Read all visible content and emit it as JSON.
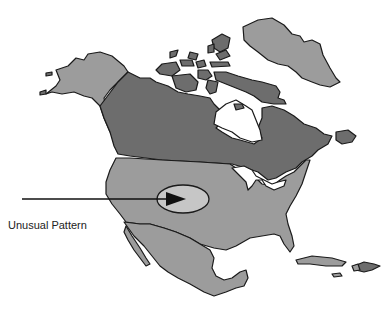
{
  "map": {
    "title": "",
    "region": "North America",
    "annotation": {
      "label": "Unusual Pattern",
      "marker": "ellipse-with-arrow",
      "location": "Central United States"
    },
    "colors": {
      "canada": "#6d6d6d",
      "usa": "#9c9c9c",
      "alaska": "#9c9c9c",
      "greenland": "#9c9c9c",
      "mexico": "#9c9c9c",
      "caribbean": "#9c9c9c",
      "highlight": "#c6c6c6",
      "outline": "#1a1a1a",
      "water": "#ffffff"
    }
  }
}
